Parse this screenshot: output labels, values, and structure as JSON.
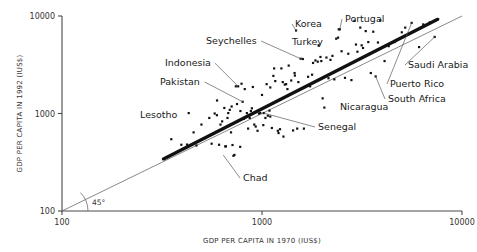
{
  "chart_data": {
    "type": "scatter",
    "title": "",
    "xlabel": "GDP PER CAPITA IN 1970 (IUS$)",
    "ylabel": "GDP PER CAPITA IN 1992 (IUS$)",
    "xscale": "log",
    "yscale": "log",
    "xlim": [
      100,
      10000
    ],
    "ylim": [
      100,
      10000
    ],
    "xticks": [
      100,
      1000,
      10000
    ],
    "yticks": [
      100,
      1000,
      10000
    ],
    "xticklabels": [
      "100",
      "1000",
      "10000"
    ],
    "yticklabels": [
      "100",
      "1000",
      "10000"
    ],
    "grid": false,
    "legend": null,
    "reference_lines": [
      {
        "name": "45-degree-line",
        "label": "45°",
        "description": "equality line y = x spanning the full axis range",
        "from": [
          100,
          100
        ],
        "to": [
          10000,
          10000
        ],
        "style": "thin"
      },
      {
        "name": "regression-line",
        "label": "",
        "description": "heavy best-fit trend line through the cloud, lying above the 45-degree line",
        "from": [
          320,
          340
        ],
        "to": [
          7600,
          9300
        ],
        "style": "thick"
      }
    ],
    "annotations": [
      {
        "label": "Korea",
        "x": 1480,
        "y": 7100,
        "text_x": 295,
        "text_y": 27,
        "leader": true
      },
      {
        "label": "Portugal",
        "x": 2450,
        "y": 7300,
        "text_x": 345,
        "text_y": 22,
        "leader": true
      },
      {
        "label": "Seychelles",
        "x": 1560,
        "y": 3650,
        "text_x": 206,
        "text_y": 44,
        "leader": true
      },
      {
        "label": "Turkey",
        "x": 1920,
        "y": 5000,
        "text_x": 292,
        "text_y": 45,
        "leader": false
      },
      {
        "label": "Saudi Arabia",
        "x": 7300,
        "y": 6100,
        "text_x": 408,
        "text_y": 68,
        "leader": true
      },
      {
        "label": "Indonesia",
        "x": 760,
        "y": 1900,
        "text_x": 165,
        "text_y": 66,
        "leader": true
      },
      {
        "label": "Pakistan",
        "x": 800,
        "y": 1320,
        "text_x": 160,
        "text_y": 85,
        "leader": true
      },
      {
        "label": "Puerto Rico",
        "x": 5600,
        "y": 8500,
        "text_x": 390,
        "text_y": 87,
        "leader": true
      },
      {
        "label": "South Africa",
        "x": 3700,
        "y": 2400,
        "text_x": 388,
        "text_y": 102,
        "leader": true
      },
      {
        "label": "Nicaragua",
        "x": 2050,
        "y": 1150,
        "text_x": 340,
        "text_y": 110,
        "leader": false
      },
      {
        "label": "Lesotho",
        "x": 420,
        "y": 1010,
        "text_x": 140,
        "text_y": 118,
        "leader": false
      },
      {
        "label": "Senegal",
        "x": 1020,
        "y": 1010,
        "text_x": 318,
        "text_y": 130,
        "leader": true
      },
      {
        "label": "Chad",
        "x": 640,
        "y": 375,
        "text_x": 243,
        "text_y": 181,
        "leader": true
      }
    ],
    "points": [
      [
        320,
        340
      ],
      [
        352,
        545
      ],
      [
        395,
        478
      ],
      [
        422,
        480
      ],
      [
        430,
        1010
      ],
      [
        455,
        640
      ],
      [
        470,
        470
      ],
      [
        498,
        770
      ],
      [
        520,
        560
      ],
      [
        545,
        900
      ],
      [
        560,
        490
      ],
      [
        580,
        1000
      ],
      [
        596,
        1360
      ],
      [
        610,
        478
      ],
      [
        620,
        770
      ],
      [
        632,
        830
      ],
      [
        648,
        1140
      ],
      [
        655,
        460
      ],
      [
        660,
        460
      ],
      [
        672,
        900
      ],
      [
        678,
        1010
      ],
      [
        690,
        1090
      ],
      [
        700,
        640
      ],
      [
        705,
        1180
      ],
      [
        712,
        475
      ],
      [
        720,
        368
      ],
      [
        728,
        376
      ],
      [
        740,
        1900
      ],
      [
        750,
        1250
      ],
      [
        760,
        1900
      ],
      [
        778,
        455
      ],
      [
        790,
        2020
      ],
      [
        800,
        1320
      ],
      [
        812,
        880
      ],
      [
        820,
        1780
      ],
      [
        840,
        1010
      ],
      [
        852,
        700
      ],
      [
        868,
        900
      ],
      [
        880,
        1060
      ],
      [
        900,
        1870
      ],
      [
        915,
        770
      ],
      [
        930,
        735
      ],
      [
        950,
        665
      ],
      [
        965,
        1000
      ],
      [
        980,
        1010
      ],
      [
        1000,
        1550
      ],
      [
        1020,
        1010
      ],
      [
        1040,
        900
      ],
      [
        1055,
        2000
      ],
      [
        1070,
        950
      ],
      [
        1090,
        1070
      ],
      [
        1100,
        1850
      ],
      [
        1120,
        710
      ],
      [
        1140,
        2430
      ],
      [
        1150,
        2900
      ],
      [
        1165,
        2150
      ],
      [
        1180,
        1330
      ],
      [
        1200,
        665
      ],
      [
        1210,
        630
      ],
      [
        1230,
        690
      ],
      [
        1250,
        2900
      ],
      [
        1270,
        2100
      ],
      [
        1280,
        580
      ],
      [
        1300,
        1980
      ],
      [
        1320,
        2000
      ],
      [
        1360,
        3100
      ],
      [
        1400,
        2180
      ],
      [
        1430,
        670
      ],
      [
        1460,
        2450
      ],
      [
        1480,
        7100
      ],
      [
        1500,
        700
      ],
      [
        1520,
        2100
      ],
      [
        1560,
        3650
      ],
      [
        1600,
        3620
      ],
      [
        1620,
        700
      ],
      [
        1700,
        2380
      ],
      [
        1740,
        1900
      ],
      [
        1780,
        2500
      ],
      [
        1800,
        3300
      ],
      [
        1850,
        3500
      ],
      [
        1900,
        3400
      ],
      [
        1920,
        5000
      ],
      [
        1960,
        3800
      ],
      [
        1980,
        3450
      ],
      [
        2010,
        1430
      ],
      [
        2050,
        1150
      ],
      [
        2100,
        3750
      ],
      [
        2150,
        2300
      ],
      [
        2200,
        3550
      ],
      [
        2300,
        2240
      ],
      [
        2350,
        5850
      ],
      [
        2400,
        6000
      ],
      [
        2420,
        7300
      ],
      [
        2450,
        7300
      ],
      [
        2500,
        4350
      ],
      [
        2600,
        2320
      ],
      [
        2700,
        4100
      ],
      [
        2800,
        2200
      ],
      [
        2900,
        8900
      ],
      [
        3000,
        4300
      ],
      [
        3100,
        7600
      ],
      [
        3150,
        5000
      ],
      [
        3200,
        4700
      ],
      [
        3300,
        7000
      ],
      [
        3400,
        5400
      ],
      [
        3500,
        2600
      ],
      [
        3600,
        6900
      ],
      [
        3700,
        2400
      ],
      [
        3800,
        5350
      ],
      [
        3900,
        9000
      ],
      [
        4100,
        3450
      ],
      [
        4300,
        4900
      ],
      [
        4600,
        5400
      ],
      [
        5000,
        6800
      ],
      [
        5200,
        7600
      ],
      [
        5600,
        8500
      ],
      [
        6100,
        4800
      ],
      [
        6400,
        8200
      ],
      [
        6900,
        8600
      ],
      [
        7300,
        6100
      ],
      [
        7600,
        9300
      ],
      [
        1100,
        930
      ],
      [
        890,
        1130
      ],
      [
        1340,
        1780
      ],
      [
        1015,
        760
      ],
      [
        780,
        1060
      ],
      [
        595,
        960
      ],
      [
        1455,
        2600
      ],
      [
        2250,
        3900
      ],
      [
        2950,
        5100
      ]
    ]
  }
}
